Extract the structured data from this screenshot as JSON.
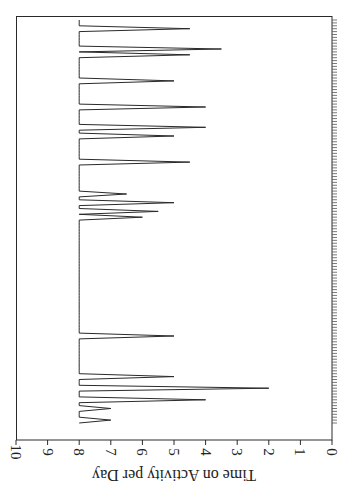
{
  "chart_data": {
    "type": "line",
    "title": "",
    "ylabel": "Time on Activity per Day",
    "xlabel": "",
    "ylim": [
      0,
      10
    ],
    "yticks": [
      0,
      1,
      2,
      3,
      4,
      5,
      6,
      7,
      8,
      9,
      10
    ],
    "grid": false,
    "legend": null,
    "orientation": "rotated-90",
    "n_days": 140,
    "baseline": 8,
    "x_tick_every": 1,
    "dips": [
      {
        "day": 4,
        "value": 4.5
      },
      {
        "day": 11,
        "value": 3.5
      },
      {
        "day": 13,
        "value": 4.5
      },
      {
        "day": 22,
        "value": 5
      },
      {
        "day": 31,
        "value": 4
      },
      {
        "day": 38,
        "value": 4
      },
      {
        "day": 41,
        "value": 5
      },
      {
        "day": 50,
        "value": 4.5
      },
      {
        "day": 61,
        "value": 6.5
      },
      {
        "day": 64,
        "value": 5
      },
      {
        "day": 67,
        "value": 5.5
      },
      {
        "day": 69,
        "value": 6
      },
      {
        "day": 110,
        "value": 5
      },
      {
        "day": 124,
        "value": 5
      },
      {
        "day": 128,
        "value": 2
      },
      {
        "day": 132,
        "value": 4
      },
      {
        "day": 135,
        "value": 7
      },
      {
        "day": 139,
        "value": 7
      }
    ],
    "series": [
      {
        "name": "Time on Activity per Day",
        "description": "Daily value of 8 except on listed dip days"
      }
    ]
  },
  "axis": {
    "title": "Time on Activity per Day",
    "tick_labels": [
      "0",
      "1",
      "2",
      "3",
      "4",
      "5",
      "6",
      "7",
      "8",
      "9",
      "10"
    ]
  }
}
